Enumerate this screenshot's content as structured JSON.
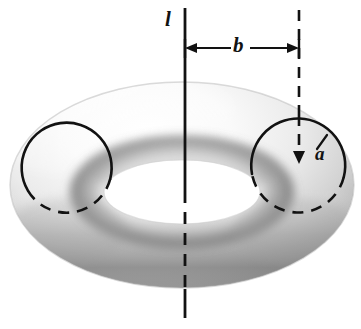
{
  "figure": {
    "name": "torus-diagram",
    "background_color": "#ffffff",
    "ink_color": "#121212",
    "width": 361,
    "height": 329
  },
  "labels": {
    "axis": "l",
    "major_radius": "b",
    "minor_radius": "a"
  },
  "geometry": {
    "axis_x": 185,
    "axis_top_y": 8,
    "axis_bottom_y": 318,
    "dimension_line_y": 48,
    "dimension_left_x": 185,
    "dimension_right_x": 299,
    "right_dashed_x": 299,
    "right_dashed_top_y": 10,
    "left_circle": {
      "cx": 68,
      "cy": 166,
      "r": 45
    },
    "right_circle": {
      "cx": 298,
      "cy": 162,
      "r": 47
    },
    "torus_outer": {
      "cx": 182,
      "cy": 185,
      "rx": 172,
      "ry": 103
    },
    "torus_hole": {
      "cx": 182,
      "cy": 192,
      "rx": 78,
      "ry": 32
    }
  },
  "shading": {
    "highlight": "#fdfdfd",
    "midtone": "#d6d6d6",
    "shadow": "#8c8c8c",
    "deep_shadow": "#6d6d6d"
  }
}
